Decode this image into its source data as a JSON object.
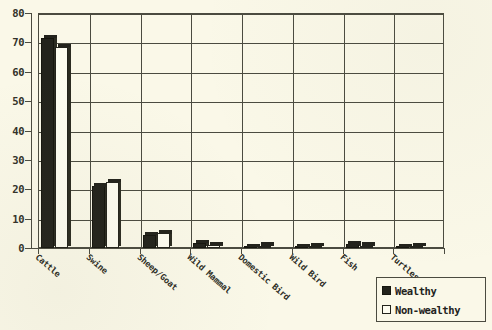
{
  "chart_data": {
    "type": "bar",
    "title": "",
    "xlabel": "",
    "ylabel": "",
    "ylim": [
      0,
      80
    ],
    "yticks": [
      0,
      10,
      20,
      30,
      40,
      50,
      60,
      70,
      80
    ],
    "grid": true,
    "legend_position": "bottom-right",
    "categories": [
      "Cattle",
      "Swine",
      "Sheep/Goat",
      "Wild Mammal",
      "Domestic Bird",
      "Wild Bird",
      "Fish",
      "Turtles"
    ],
    "series": [
      {
        "name": "Wealthy",
        "color": "#23231c",
        "fill": "solid",
        "values": [
          71.5,
          21.0,
          4.5,
          1.8,
          0.4,
          0.3,
          1.2,
          0.3
        ]
      },
      {
        "name": "Non-wealthy",
        "color": "#fdfcf0",
        "fill": "hollow",
        "values": [
          68.5,
          22.5,
          5.0,
          1.0,
          0.8,
          0.7,
          0.8,
          0.6
        ]
      }
    ]
  },
  "legend": {
    "items": [
      {
        "label": "Wealthy",
        "style": "filled"
      },
      {
        "label": "Non-wealthy",
        "style": "hollow"
      }
    ]
  },
  "axis": {
    "y_tick_labels": [
      "80",
      "70",
      "60",
      "50",
      "40",
      "30",
      "20",
      "10",
      "0"
    ]
  }
}
